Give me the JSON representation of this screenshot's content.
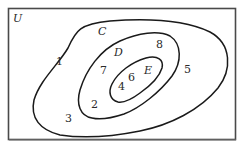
{
  "diagram": {
    "type": "nested-venn",
    "universe": {
      "label": "U"
    },
    "sets": [
      {
        "name": "C",
        "label": "C",
        "contains": [
          "D"
        ]
      },
      {
        "name": "D",
        "label": "D",
        "contains": [
          "E"
        ]
      },
      {
        "name": "E",
        "label": "E",
        "contains": []
      }
    ],
    "elements": {
      "only_U": [
        "3"
      ],
      "C_not_D": [
        "1",
        "5"
      ],
      "D_not_E": [
        "7",
        "8",
        "2"
      ],
      "E": [
        "4",
        "6"
      ]
    },
    "labels": {
      "n1": "1",
      "n2": "2",
      "n3": "3",
      "n4": "4",
      "n5": "5",
      "n6": "6",
      "n7": "7",
      "n8": "8"
    },
    "colors": {
      "stroke": "#1a1a1a",
      "frame": "#4a4a4a",
      "background": "#ffffff"
    }
  }
}
